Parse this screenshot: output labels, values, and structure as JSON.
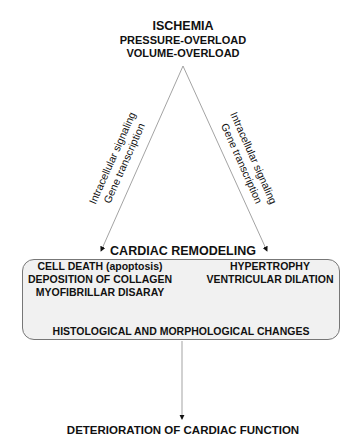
{
  "top": {
    "title": "ISCHEMIA",
    "line2": "PRESSURE-OVERLOAD",
    "line3": "VOLUME-OVERLOAD"
  },
  "left_branch": {
    "line1": "Intracellular signaling",
    "line2": "Gene transcription"
  },
  "right_branch": {
    "line1": "Intracellular signaling",
    "line2": "Gene transcription"
  },
  "remodeling": {
    "title": "CARDIAC REMODELING",
    "left_items": [
      "CELL DEATH (apoptosis)",
      "DEPOSITION OF COLLAGEN",
      "MYOFIBRILLAR DISARAY"
    ],
    "right_items": [
      "HYPERTROPHY",
      "VENTRICULAR DILATION"
    ],
    "result": "HISTOLOGICAL AND MORPHOLOGICAL CHANGES"
  },
  "outcome": "DETERIORATION OF CARDIAC FUNCTION",
  "colors": {
    "box_fill": "#f1f1f1",
    "box_border": "#777777",
    "line": "#999999",
    "text": "#111111"
  }
}
